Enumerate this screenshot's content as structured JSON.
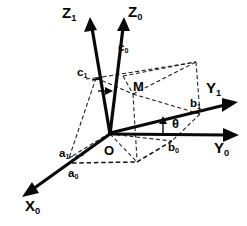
{
  "figure": {
    "background_color": "#ffffff",
    "line_color": "#0a0a0a",
    "width": 247,
    "height": 226
  },
  "axes": [
    {
      "id": "z1",
      "name": "Z1",
      "letter": "Z",
      "subscript": "1",
      "label": "Z₁",
      "style": "solid",
      "description": "rotated vertical axis, tilted left"
    },
    {
      "id": "z0",
      "name": "Z0",
      "letter": "Z",
      "subscript": "0",
      "label": "Z₀",
      "style": "solid",
      "description": "original vertical axis"
    },
    {
      "id": "y1",
      "name": "Y1",
      "letter": "Y",
      "subscript": "1",
      "label": "Y₁",
      "style": "solid",
      "description": "rotated horizontal axis, upper right"
    },
    {
      "id": "y0",
      "name": "Y0",
      "letter": "Y",
      "subscript": "0",
      "label": "Y₀",
      "style": "solid",
      "description": "original horizontal axis, right"
    },
    {
      "id": "x0",
      "name": "X0",
      "letter": "X",
      "subscript": "0",
      "label": "X₀",
      "style": "solid",
      "description": "original depth axis, lower left"
    }
  ],
  "components": [
    {
      "id": "c0",
      "letter": "c",
      "subscript": "0",
      "label": "c₀",
      "axis": "Z0"
    },
    {
      "id": "c1",
      "letter": "c",
      "subscript": "1",
      "label": "c₁",
      "axis": "Z1"
    },
    {
      "id": "b1",
      "letter": "b",
      "subscript": "1",
      "label": "b₁",
      "axis": "Y1"
    },
    {
      "id": "b0",
      "letter": "b",
      "subscript": "0",
      "label": "b₀",
      "axis": "Y0"
    },
    {
      "id": "a1",
      "letter": "a",
      "subscript": "1",
      "label": "a₁",
      "axis": "X1"
    },
    {
      "id": "a0",
      "letter": "a",
      "subscript": "0",
      "label": "a₀",
      "axis": "X0"
    }
  ],
  "points": [
    {
      "id": "origin",
      "label": "O",
      "description": "origin of both coordinate systems"
    },
    {
      "id": "m",
      "label": "M",
      "description": "point M with components a, b, c"
    }
  ],
  "angles": [
    {
      "id": "theta",
      "label": "θ",
      "description": "rotation angle between Y0 and Y1"
    }
  ],
  "labels": {
    "z1": "Z",
    "z1_sub": "1",
    "z0": "Z",
    "z0_sub": "0",
    "y1": "Y",
    "y1_sub": "1",
    "y0": "Y",
    "y0_sub": "0",
    "x0": "X",
    "x0_sub": "0",
    "c0": "c",
    "c0_sub": "0",
    "c1": "c",
    "c1_sub": "1",
    "b1": "b",
    "b1_sub": "1",
    "b0": "b",
    "b0_sub": "0",
    "a1": "a",
    "a1_sub": "1",
    "a0": "a",
    "a0_sub": "0",
    "origin": "O",
    "point_m": "M",
    "theta": "θ"
  }
}
